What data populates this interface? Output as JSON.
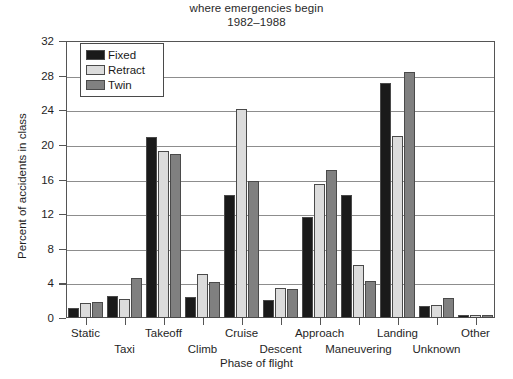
{
  "chart_data": {
    "type": "bar",
    "title": "where emergencies begin\n1982–1988",
    "title_line1": "where emergencies begin",
    "title_line2": "1982–1988",
    "xlabel": "Phase of flight",
    "ylabel": "Percent of accidents in class",
    "ylim": [
      0,
      32
    ],
    "yticks": [
      0,
      4,
      8,
      12,
      16,
      20,
      24,
      28,
      32
    ],
    "ytick_labels": [
      "0",
      "4",
      "8",
      "12",
      "16",
      "20",
      "24",
      "28",
      "32"
    ],
    "grid": true,
    "grid_axis": "y",
    "legend_position": "upper left",
    "categories": [
      "Static",
      "Taxi",
      "Takeoff",
      "Climb",
      "Cruise",
      "Descent",
      "Approach",
      "Maneuvering",
      "Landing",
      "Unknown",
      "Other"
    ],
    "series": [
      {
        "name": "Fixed",
        "color": "#1a1a1a",
        "values": [
          1.1,
          2.6,
          20.9,
          2.4,
          14.2,
          2.1,
          11.7,
          14.2,
          27.2,
          1.4,
          0.4
        ]
      },
      {
        "name": "Retract",
        "color": "#dcdcdc",
        "values": [
          1.7,
          2.2,
          19.3,
          5.1,
          24.2,
          3.5,
          15.5,
          6.1,
          21.0,
          1.5,
          0.4
        ]
      },
      {
        "name": "Twin",
        "color": "#808080",
        "values": [
          1.9,
          4.6,
          18.9,
          4.2,
          15.8,
          3.4,
          17.1,
          4.3,
          28.4,
          2.3,
          0.4
        ]
      }
    ]
  },
  "legend": {
    "items": [
      {
        "label": "Fixed"
      },
      {
        "label": "Retract"
      },
      {
        "label": "Twin"
      }
    ]
  }
}
